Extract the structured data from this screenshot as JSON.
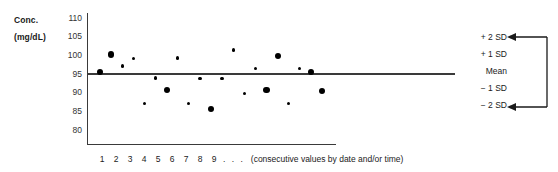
{
  "chart_data": {
    "type": "scatter",
    "title": "",
    "subtitle": "",
    "ylabel_line1": "Conc.",
    "ylabel_line2": "(mg/dL)",
    "xlabel": "1 2 3 4 5 6 7 8 9 . . . (consecutive values by date and/or time)",
    "x_tick_numbers": [
      "1",
      "2",
      "3",
      "4",
      "5",
      "6",
      "7",
      "8",
      "9"
    ],
    "x_dots": ". . .",
    "x_caption": "(consecutive values by date and/or time)",
    "y_ticks": [
      "110",
      "105",
      "100",
      "95",
      "90",
      "85",
      "80"
    ],
    "ylim": [
      78,
      111
    ],
    "xlim": [
      0,
      18
    ],
    "grid": false,
    "legend": "none",
    "mean_value": 93,
    "reference_lines": [
      {
        "label": "Mean",
        "value": 93,
        "drawn": true
      }
    ],
    "sd_labels": [
      "+ 2 SD",
      "+ 1 SD",
      "Mean",
      "− 1 SD",
      "− 2 SD"
    ],
    "annotation_bracket": "arrows pointing to +2 SD and -2 SD",
    "marker_color": "#000000",
    "axis_color": "#3a3a3a",
    "points": [
      {
        "x": 1,
        "y": 95.3,
        "size": "large"
      },
      {
        "x": 2,
        "y": 100.1,
        "size": "large"
      },
      {
        "x": 3,
        "y": 97.0,
        "size": "small"
      },
      {
        "x": 4,
        "y": 99.0,
        "size": "small"
      },
      {
        "x": 5,
        "y": 87.0,
        "size": "small"
      },
      {
        "x": 6,
        "y": 93.8,
        "size": "small"
      },
      {
        "x": 7,
        "y": 90.6,
        "size": "large"
      },
      {
        "x": 8,
        "y": 99.2,
        "size": "small"
      },
      {
        "x": 9,
        "y": 86.9,
        "size": "small"
      },
      {
        "x": 10,
        "y": 93.7,
        "size": "small"
      },
      {
        "x": 11,
        "y": 85.4,
        "size": "large"
      },
      {
        "x": 12,
        "y": 93.7,
        "size": "small"
      },
      {
        "x": 13,
        "y": 101.3,
        "size": "small"
      },
      {
        "x": 14,
        "y": 89.6,
        "size": "small"
      },
      {
        "x": 15,
        "y": 96.3,
        "size": "small"
      },
      {
        "x": 16,
        "y": 90.6,
        "size": "large"
      },
      {
        "x": 17,
        "y": 99.6,
        "size": "large"
      },
      {
        "x": 18,
        "y": 86.9,
        "size": "small"
      },
      {
        "x": 19,
        "y": 96.4,
        "size": "small"
      },
      {
        "x": 20,
        "y": 95.3,
        "size": "large"
      },
      {
        "x": 21,
        "y": 90.4,
        "size": "large"
      }
    ]
  }
}
